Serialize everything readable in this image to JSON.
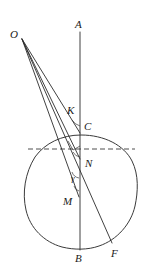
{
  "figure": {
    "background_color": "#ffffff",
    "line_color": "#2b2b2b",
    "curve_color": "#3a3a3a",
    "label_color": "#1a1a1a",
    "width": 156,
    "height": 269
  },
  "labels": {
    "A": "A",
    "O": "O",
    "K": "K",
    "C": "C",
    "N": "N",
    "M": "M",
    "B": "B",
    "F": "F",
    "gamma": "γ"
  },
  "points": {
    "A": {
      "label": "A",
      "x": 79,
      "y": 24,
      "vertex_x": 80,
      "vertex_y": 32
    },
    "O": {
      "label": "O",
      "x": 14,
      "y": 34,
      "vertex_x": 22,
      "vertex_y": 39
    },
    "K": {
      "label": "K",
      "x": 72,
      "y": 110,
      "vertex_x": 80,
      "vertex_y": 118
    },
    "C": {
      "label": "C",
      "x": 88,
      "y": 126,
      "vertex_x": 80,
      "vertex_y": 133
    },
    "N": {
      "label": "N",
      "x": 88,
      "y": 163,
      "vertex_x": 80,
      "vertex_y": 158
    },
    "M": {
      "label": "M",
      "x": 68,
      "y": 201,
      "vertex_x": 80,
      "vertex_y": 196
    },
    "B": {
      "label": "B",
      "x": 77,
      "y": 258,
      "vertex_x": 80,
      "vertex_y": 249
    },
    "F": {
      "label": "F",
      "x": 114,
      "y": 253,
      "vertex_x": 112,
      "vertex_y": 242
    }
  },
  "angles": [
    {
      "name": "angle-at-C",
      "label": "",
      "x": 80,
      "y": 133
    },
    {
      "name": "angle-bracket-upper",
      "label": "",
      "x": 74,
      "y": 147
    },
    {
      "name": "angle-at-N",
      "label": "",
      "x": 80,
      "y": 158
    },
    {
      "name": "angle-gamma",
      "label": "γ",
      "x": 76,
      "y": 178
    }
  ],
  "segments": [
    {
      "name": "axis-AB",
      "from": "A",
      "to": "B",
      "style": "solid"
    },
    {
      "name": "ray-O-to-C",
      "from": "O",
      "to": "C",
      "style": "solid"
    },
    {
      "name": "ray-O-to-N",
      "from": "O",
      "to": "N",
      "style": "solid"
    },
    {
      "name": "ray-O-to-M",
      "from": "O",
      "to": "M",
      "style": "solid"
    },
    {
      "name": "ray-O-to-F",
      "from": "O",
      "to": "F",
      "style": "solid"
    },
    {
      "name": "chord-dashed-horizontal",
      "from": "left-rim",
      "to": "right-rim",
      "style": "dashed"
    }
  ],
  "shapes": [
    {
      "name": "oval-outline",
      "type": "closed-curve",
      "cx": 81,
      "cy": 192,
      "rx": 56,
      "ry": 57
    }
  ]
}
